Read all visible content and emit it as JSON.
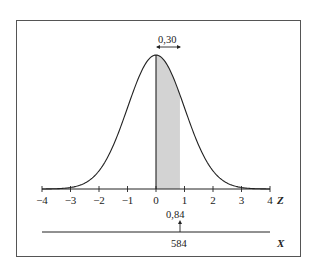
{
  "chart_data": {
    "type": "area",
    "title": "",
    "distribution": "standard normal",
    "x": [
      -4,
      -3.5,
      -3,
      -2.5,
      -2,
      -1.5,
      -1,
      -0.5,
      0,
      0.5,
      1,
      1.5,
      2,
      2.5,
      3,
      3.5,
      4
    ],
    "series": [
      {
        "name": "density",
        "values": [
          0.0001,
          0.0009,
          0.0044,
          0.0175,
          0.054,
          0.1295,
          0.242,
          0.3521,
          0.3989,
          0.3521,
          0.242,
          0.1295,
          0.054,
          0.0175,
          0.0044,
          0.0009,
          0.0001
        ]
      }
    ],
    "shaded_region": {
      "from": 0,
      "to": 0.84,
      "area_label": "0,30",
      "color": "#d3d3d3"
    },
    "xlabel": "Z",
    "secondary_axis_label": "X",
    "xlim": [
      -4,
      4
    ],
    "xticks": [
      -4,
      -3,
      -2,
      -1,
      0,
      1,
      2,
      3,
      4
    ],
    "xtick_labels": [
      "−4",
      "−3",
      "−2",
      "−1",
      "0",
      "1",
      "2",
      "3",
      "4"
    ],
    "annotations": [
      {
        "text": "0,30",
        "position": "above peak, double arrow spanning shaded width"
      },
      {
        "text": "0,84",
        "position": "below Z axis at z = 0.84"
      },
      {
        "text": "584",
        "position": "on X axis, corresponding to z = 0.84"
      }
    ],
    "grid": false,
    "legend": null
  },
  "labels": {
    "area": "0,30",
    "z_value": "0,84",
    "x_value": "584",
    "z_axis": "Z",
    "x_axis": "X",
    "ticks": [
      "−4",
      "−3",
      "−2",
      "−1",
      "0",
      "1",
      "2",
      "3",
      "4"
    ]
  },
  "colors": {
    "curve": "#222222",
    "shade": "#d3d3d3",
    "frame": "#555555"
  }
}
